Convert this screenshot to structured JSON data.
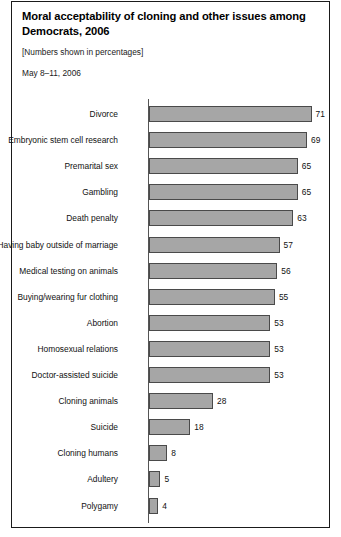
{
  "chart_data": {
    "type": "bar",
    "title": "Moral acceptability of cloning and other issues among Democrats, 2006",
    "subtitle": "[Numbers shown in percentages]",
    "date_note": "May 8–11, 2006",
    "orientation": "horizontal",
    "xlabel": "",
    "ylabel": "",
    "xlim": [
      0,
      71
    ],
    "grid": false,
    "legend": "none",
    "axis_baseline": 0,
    "categories": [
      "Divorce",
      "Embryonic stem cell research",
      "Premarital sex",
      "Gambling",
      "Death penalty",
      "Having baby outside of marriage",
      "Medical testing on animals",
      "Buying/wearing fur clothing",
      "Abortion",
      "Homosexual relations",
      "Doctor-assisted suicide",
      "Cloning animals",
      "Suicide",
      "Cloning humans",
      "Adultery",
      "Polygamy"
    ],
    "values": [
      71,
      69,
      65,
      65,
      63,
      57,
      56,
      55,
      53,
      53,
      53,
      28,
      18,
      8,
      5,
      4
    ],
    "value_labels": [
      "71",
      "69",
      "65",
      "65",
      "63",
      "57",
      "56",
      "55",
      "53",
      "53",
      "53",
      "28",
      "18",
      "8",
      "5",
      "4"
    ],
    "colors": {
      "bar_fill": "#a6a6a6",
      "bar_stroke": "#4a4a4a",
      "axis": "#555555",
      "text": "#111111",
      "border": "#1a1a1a",
      "background": "#ffffff"
    }
  }
}
